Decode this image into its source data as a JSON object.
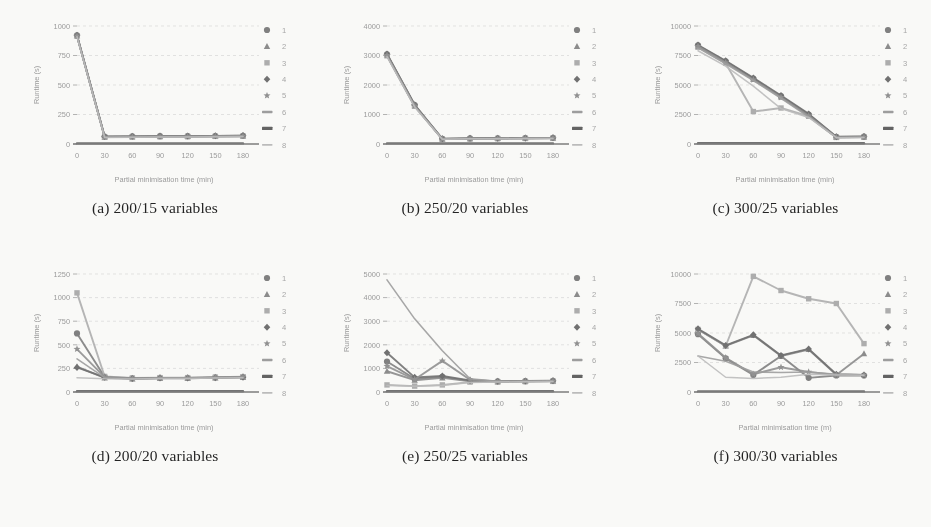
{
  "figure": {
    "panel_count": 6,
    "series_count": 8,
    "legend_labels": [
      "1",
      "2",
      "3",
      "4",
      "5",
      "6",
      "7",
      "8"
    ],
    "legend_markers": [
      "circle",
      "triangle",
      "square",
      "diamond",
      "star",
      "dash",
      "thick-dash",
      "light-dash"
    ],
    "series_colors": [
      "#7d7d7d",
      "#8a8a8a",
      "#adadad",
      "#6e6e6e",
      "#8f8f8f",
      "#9c9c9c",
      "#5f5f5f",
      "#bcbcbc"
    ],
    "axis_color": "#a0a0a0",
    "grid_color": "#d8d8d8",
    "baseline_color": "#7a7a7a"
  },
  "chart_data": [
    {
      "id": "a",
      "type": "line",
      "caption": "(a) 200/15 variables",
      "xlabel": "Partial minimisation time (min)",
      "ylabel": "Runtime (s)",
      "x": [
        0,
        30,
        60,
        90,
        120,
        150,
        180
      ],
      "xticks": [
        "0",
        "30",
        "60",
        "90",
        "120",
        "150",
        "180"
      ],
      "yticks": [
        "0",
        "250",
        "500",
        "750",
        "1000"
      ],
      "ylim": [
        0,
        1000
      ],
      "xlim": [
        0,
        180
      ],
      "grid": true,
      "legend_position": "right",
      "series": [
        {
          "name": "1",
          "marker": "circle",
          "values": [
            920,
            62,
            64,
            66,
            66,
            68,
            70
          ]
        },
        {
          "name": "2",
          "marker": "triangle",
          "values": [
            918,
            60,
            62,
            64,
            65,
            66,
            68
          ]
        },
        {
          "name": "3",
          "marker": "square",
          "values": [
            915,
            58,
            60,
            62,
            63,
            65,
            66
          ]
        },
        {
          "name": "4",
          "marker": "diamond",
          "values": [
            922,
            63,
            65,
            67,
            67,
            69,
            71
          ]
        },
        {
          "name": "5",
          "marker": "star",
          "values": [
            916,
            59,
            61,
            63,
            64,
            66,
            67
          ]
        },
        {
          "name": "6",
          "marker": "dash",
          "values": [
            914,
            57,
            59,
            61,
            62,
            64,
            65
          ]
        },
        {
          "name": "7",
          "marker": "thick-dash",
          "values": [
            5,
            5,
            5,
            5,
            5,
            5,
            5
          ]
        },
        {
          "name": "8",
          "marker": "light-dash",
          "values": [
            910,
            55,
            57,
            59,
            60,
            62,
            63
          ]
        }
      ]
    },
    {
      "id": "b",
      "type": "line",
      "caption": "(b) 250/20 variables",
      "xlabel": "Partial minimisation time (min)",
      "ylabel": "Runtime (s)",
      "x": [
        0,
        30,
        60,
        90,
        120,
        150,
        180
      ],
      "xticks": [
        "0",
        "30",
        "60",
        "90",
        "120",
        "150",
        "180"
      ],
      "yticks": [
        "0",
        "1000",
        "2000",
        "3000",
        "4000"
      ],
      "ylim": [
        0,
        4000
      ],
      "xlim": [
        0,
        180
      ],
      "grid": true,
      "legend_position": "right",
      "series": [
        {
          "name": "1",
          "marker": "circle",
          "values": [
            3040,
            1320,
            175,
            190,
            195,
            200,
            205
          ]
        },
        {
          "name": "2",
          "marker": "triangle",
          "values": [
            3020,
            1300,
            170,
            185,
            190,
            195,
            200
          ]
        },
        {
          "name": "3",
          "marker": "square",
          "values": [
            2990,
            1280,
            165,
            180,
            185,
            190,
            195
          ]
        },
        {
          "name": "4",
          "marker": "diamond",
          "values": [
            3050,
            1330,
            178,
            192,
            198,
            203,
            208
          ]
        },
        {
          "name": "5",
          "marker": "star",
          "values": [
            3010,
            1295,
            168,
            183,
            188,
            193,
            198
          ]
        },
        {
          "name": "6",
          "marker": "dash",
          "values": [
            2980,
            1270,
            162,
            178,
            183,
            188,
            193
          ]
        },
        {
          "name": "7",
          "marker": "thick-dash",
          "values": [
            20,
            20,
            20,
            20,
            20,
            20,
            20
          ]
        },
        {
          "name": "8",
          "marker": "light-dash",
          "values": [
            2960,
            1255,
            158,
            174,
            180,
            185,
            190
          ]
        }
      ]
    },
    {
      "id": "c",
      "type": "line",
      "caption": "(c) 300/25 variables",
      "xlabel": "Partial minimisation time (min)",
      "ylabel": "Runtime (s)",
      "x": [
        0,
        30,
        60,
        90,
        120,
        150,
        180
      ],
      "xticks": [
        "0",
        "30",
        "60",
        "90",
        "120",
        "150",
        "180"
      ],
      "yticks": [
        "0",
        "2500",
        "5000",
        "7500",
        "10000"
      ],
      "ylim": [
        0,
        10000
      ],
      "xlim": [
        0,
        180
      ],
      "grid": true,
      "legend_position": "right",
      "series": [
        {
          "name": "1",
          "marker": "circle",
          "values": [
            8350,
            7000,
            5550,
            4050,
            2500,
            600,
            620
          ]
        },
        {
          "name": "2",
          "marker": "triangle",
          "values": [
            8300,
            6950,
            5500,
            4000,
            2450,
            580,
            600
          ]
        },
        {
          "name": "3",
          "marker": "square",
          "values": [
            8200,
            6850,
            2750,
            3050,
            2350,
            560,
            580
          ]
        },
        {
          "name": "4",
          "marker": "diamond",
          "values": [
            8380,
            7050,
            5600,
            4100,
            2550,
            610,
            630
          ]
        },
        {
          "name": "5",
          "marker": "star",
          "values": [
            8280,
            6900,
            5450,
            3950,
            2400,
            570,
            590
          ]
        },
        {
          "name": "6",
          "marker": "dash",
          "values": [
            8150,
            6800,
            5380,
            3880,
            2300,
            550,
            570
          ]
        },
        {
          "name": "7",
          "marker": "thick-dash",
          "values": [
            60,
            60,
            60,
            60,
            60,
            60,
            60
          ]
        },
        {
          "name": "8",
          "marker": "light-dash",
          "values": [
            7900,
            6600,
            4900,
            3000,
            2250,
            540,
            560
          ]
        }
      ]
    },
    {
      "id": "d",
      "type": "line",
      "caption": "(d) 200/20 variables",
      "xlabel": "Partial minimisation time (min)",
      "ylabel": "Runtime (s)",
      "x": [
        0,
        30,
        60,
        90,
        120,
        150,
        180
      ],
      "xticks": [
        "0",
        "30",
        "60",
        "90",
        "120",
        "150",
        "180"
      ],
      "yticks": [
        "0",
        "250",
        "500",
        "750",
        "1000",
        "1250"
      ],
      "ylim": [
        0,
        1250
      ],
      "xlim": [
        0,
        180
      ],
      "grid": true,
      "legend_position": "right",
      "series": [
        {
          "name": "1",
          "marker": "circle",
          "values": [
            620,
            160,
            145,
            150,
            150,
            155,
            160
          ]
        },
        {
          "name": "2",
          "marker": "triangle",
          "values": [
            270,
            150,
            140,
            145,
            145,
            150,
            155
          ]
        },
        {
          "name": "3",
          "marker": "square",
          "values": [
            1050,
            165,
            148,
            152,
            152,
            157,
            162
          ]
        },
        {
          "name": "4",
          "marker": "diamond",
          "values": [
            260,
            155,
            142,
            147,
            147,
            152,
            157
          ]
        },
        {
          "name": "5",
          "marker": "star",
          "values": [
            455,
            158,
            143,
            148,
            148,
            153,
            158
          ]
        },
        {
          "name": "6",
          "marker": "dash",
          "values": [
            350,
            152,
            141,
            146,
            146,
            151,
            156
          ]
        },
        {
          "name": "7",
          "marker": "thick-dash",
          "values": [
            8,
            8,
            8,
            8,
            8,
            8,
            8
          ]
        },
        {
          "name": "8",
          "marker": "light-dash",
          "values": [
            150,
            140,
            138,
            143,
            143,
            148,
            152
          ]
        }
      ]
    },
    {
      "id": "e",
      "type": "line",
      "caption": "(e) 250/25 variables",
      "xlabel": "Partial minimisation time (min)",
      "ylabel": "Runtime (s)",
      "x": [
        0,
        30,
        60,
        90,
        120,
        150,
        180
      ],
      "xticks": [
        "0",
        "30",
        "60",
        "90",
        "120",
        "150",
        "180"
      ],
      "yticks": [
        "0",
        "1000",
        "2000",
        "3000",
        "4000",
        "5000"
      ],
      "ylim": [
        0,
        5000
      ],
      "xlim": [
        0,
        180
      ],
      "grid": true,
      "legend_position": "right",
      "series": [
        {
          "name": "1",
          "marker": "circle",
          "values": [
            1290,
            560,
            640,
            470,
            450,
            460,
            470
          ]
        },
        {
          "name": "2",
          "marker": "triangle",
          "values": [
            880,
            500,
            600,
            450,
            440,
            450,
            460
          ]
        },
        {
          "name": "3",
          "marker": "square",
          "values": [
            300,
            250,
            300,
            420,
            430,
            440,
            450
          ]
        },
        {
          "name": "4",
          "marker": "diamond",
          "values": [
            1660,
            620,
            680,
            490,
            460,
            470,
            480
          ]
        },
        {
          "name": "5",
          "marker": "star",
          "values": [
            1100,
            530,
            1320,
            520,
            445,
            455,
            465
          ]
        },
        {
          "name": "6",
          "marker": "dash",
          "values": [
            4750,
            3100,
            1750,
            560,
            450,
            455,
            465
          ]
        },
        {
          "name": "7",
          "marker": "thick-dash",
          "values": [
            30,
            30,
            30,
            30,
            30,
            30,
            30
          ]
        },
        {
          "name": "8",
          "marker": "light-dash",
          "values": [
            280,
            240,
            280,
            400,
            425,
            435,
            445
          ]
        }
      ]
    },
    {
      "id": "f",
      "type": "line",
      "caption": "(f) 300/30 variables",
      "xlabel": "Partial minimisation time (m)",
      "ylabel": "Runtime (s)",
      "x": [
        0,
        30,
        60,
        90,
        120,
        150,
        180
      ],
      "xticks": [
        "0",
        "30",
        "60",
        "90",
        "120",
        "150",
        "180"
      ],
      "yticks": [
        "0",
        "2500",
        "5000",
        "7500",
        "10000"
      ],
      "ylim": [
        0,
        10000
      ],
      "xlim": [
        0,
        180
      ],
      "grid": true,
      "legend_position": "right",
      "series": [
        {
          "name": "1",
          "marker": "circle",
          "values": [
            4900,
            2850,
            1450,
            3050,
            1200,
            1400,
            1400
          ]
        },
        {
          "name": "2",
          "marker": "triangle",
          "values": [
            5300,
            3900,
            4800,
            3050,
            3600,
            1450,
            3250
          ]
        },
        {
          "name": "3",
          "marker": "square",
          "values": [
            5300,
            3900,
            9800,
            8600,
            7900,
            7500,
            4100
          ]
        },
        {
          "name": "4",
          "marker": "diamond",
          "values": [
            5350,
            3950,
            4850,
            3100,
            3650,
            1500,
            1450
          ]
        },
        {
          "name": "5",
          "marker": "star",
          "values": [
            4950,
            2900,
            1500,
            2100,
            1700,
            1450,
            1430
          ]
        },
        {
          "name": "6",
          "marker": "dash",
          "values": [
            3050,
            2600,
            1700,
            1650,
            1700,
            1500,
            1450
          ]
        },
        {
          "name": "7",
          "marker": "thick-dash",
          "values": [
            50,
            50,
            50,
            50,
            50,
            50,
            50
          ]
        },
        {
          "name": "8",
          "marker": "light-dash",
          "values": [
            3050,
            1250,
            1150,
            1250,
            1500,
            1450,
            1420
          ]
        }
      ]
    }
  ]
}
